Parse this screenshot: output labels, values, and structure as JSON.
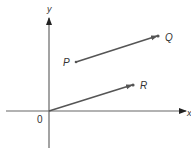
{
  "diagram": {
    "axes": {
      "x_label": "x",
      "y_label": "y",
      "origin_label": "0",
      "color": "#555555"
    },
    "points": [
      {
        "id": "P",
        "label": "P"
      },
      {
        "id": "Q",
        "label": "Q"
      },
      {
        "id": "R",
        "label": "R"
      }
    ],
    "vectors": [
      {
        "from": "P",
        "to": "Q"
      },
      {
        "from": "0",
        "to": "R"
      }
    ],
    "vector_color": "#555555"
  }
}
